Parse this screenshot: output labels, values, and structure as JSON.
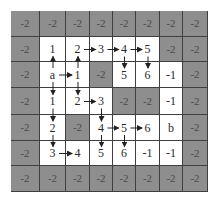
{
  "colors": {
    "blocked": "#8e8e8e",
    "open": "#ffffff",
    "line": "#3f3f3f",
    "text": "#2a2a2a",
    "blocked_text": "#4a4a4a"
  },
  "grid": {
    "rows": 7,
    "cols": 8,
    "col_edges": [
      11,
      40,
      66,
      90,
      113,
      136,
      160,
      183,
      208
    ],
    "row_edges": [
      11,
      37,
      62,
      88,
      115,
      141,
      166,
      192
    ],
    "cells": [
      [
        "-2",
        "-2",
        "-2",
        "-2",
        "-2",
        "-2",
        "-2",
        "-2"
      ],
      [
        "-2",
        "1",
        "2",
        "3",
        "4",
        "5",
        "-2",
        "-2"
      ],
      [
        "-2",
        "a",
        "1",
        "-2",
        "5",
        "6",
        "-1",
        "-2"
      ],
      [
        "-2",
        "1",
        "2",
        "3",
        "-2",
        "-2",
        "-1",
        "-2"
      ],
      [
        "-2",
        "2",
        "-2",
        "4",
        "5",
        "6",
        "b",
        "-2"
      ],
      [
        "-2",
        "3",
        "4",
        "5",
        "6",
        "-1",
        "-1",
        "-2"
      ],
      [
        "-2",
        "-2",
        "-2",
        "-2",
        "-2",
        "-2",
        "-2",
        "-2"
      ]
    ],
    "blocked": [
      [
        1,
        1,
        1,
        1,
        1,
        1,
        1,
        1
      ],
      [
        1,
        0,
        0,
        0,
        0,
        0,
        1,
        1
      ],
      [
        1,
        0,
        0,
        1,
        0,
        0,
        0,
        1
      ],
      [
        1,
        0,
        0,
        0,
        1,
        1,
        0,
        1
      ],
      [
        1,
        0,
        1,
        0,
        0,
        0,
        0,
        1
      ],
      [
        1,
        0,
        0,
        0,
        0,
        0,
        0,
        1
      ],
      [
        1,
        1,
        1,
        1,
        1,
        1,
        1,
        1
      ]
    ]
  },
  "arrows": [
    {
      "from": [
        2,
        1
      ],
      "to": [
        1,
        1
      ]
    },
    {
      "from": [
        2,
        1
      ],
      "to": [
        3,
        1
      ]
    },
    {
      "from": [
        2,
        1
      ],
      "to": [
        2,
        2
      ]
    },
    {
      "from": [
        2,
        2
      ],
      "to": [
        1,
        2
      ]
    },
    {
      "from": [
        2,
        2
      ],
      "to": [
        3,
        2
      ]
    },
    {
      "from": [
        1,
        2
      ],
      "to": [
        1,
        3
      ]
    },
    {
      "from": [
        1,
        3
      ],
      "to": [
        1,
        4
      ]
    },
    {
      "from": [
        1,
        4
      ],
      "to": [
        1,
        5
      ]
    },
    {
      "from": [
        1,
        4
      ],
      "to": [
        2,
        4
      ]
    },
    {
      "from": [
        1,
        5
      ],
      "to": [
        2,
        5
      ]
    },
    {
      "from": [
        3,
        2
      ],
      "to": [
        3,
        3
      ]
    },
    {
      "from": [
        3,
        3
      ],
      "to": [
        4,
        3
      ]
    },
    {
      "from": [
        3,
        1
      ],
      "to": [
        4,
        1
      ]
    },
    {
      "from": [
        4,
        1
      ],
      "to": [
        5,
        1
      ]
    },
    {
      "from": [
        5,
        1
      ],
      "to": [
        5,
        2
      ]
    },
    {
      "from": [
        4,
        3
      ],
      "to": [
        4,
        4
      ]
    },
    {
      "from": [
        4,
        4
      ],
      "to": [
        4,
        5
      ]
    },
    {
      "from": [
        4,
        3
      ],
      "to": [
        5,
        3
      ]
    },
    {
      "from": [
        4,
        4
      ],
      "to": [
        5,
        4
      ]
    }
  ]
}
